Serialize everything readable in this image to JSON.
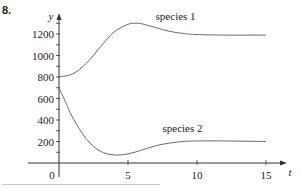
{
  "problem_number": "8.",
  "chart_data": {
    "type": "line",
    "title": "",
    "xlabel": "t",
    "ylabel": "y",
    "xlim": [
      0,
      16
    ],
    "ylim": [
      0,
      1300
    ],
    "x_ticks": [
      0,
      5,
      10,
      15
    ],
    "x_tick_labels": [
      "0",
      "5",
      "10",
      "15"
    ],
    "y_ticks": [
      200,
      400,
      600,
      800,
      1000,
      1200
    ],
    "y_tick_labels": [
      "200",
      "400",
      "600",
      "800",
      "1000",
      "1200"
    ],
    "y_minor_tick_step": 100,
    "grid": false,
    "legend": "inline labels",
    "series": [
      {
        "name": "species 1",
        "label_position": {
          "t": 7,
          "y": 1330
        },
        "x": [
          0,
          1,
          2,
          3,
          4,
          5,
          5.5,
          6,
          7,
          8,
          9,
          10,
          12,
          15
        ],
        "values": [
          800,
          830,
          930,
          1080,
          1220,
          1290,
          1300,
          1295,
          1260,
          1225,
          1205,
          1195,
          1190,
          1190
        ]
      },
      {
        "name": "species 2",
        "label_position": {
          "t": 7.5,
          "y": 290
        },
        "x": [
          0,
          0.5,
          1,
          2,
          3,
          4,
          5,
          6,
          7,
          8,
          9,
          10,
          12,
          15
        ],
        "values": [
          700,
          560,
          420,
          220,
          110,
          75,
          85,
          120,
          160,
          185,
          200,
          205,
          205,
          200
        ]
      }
    ]
  }
}
